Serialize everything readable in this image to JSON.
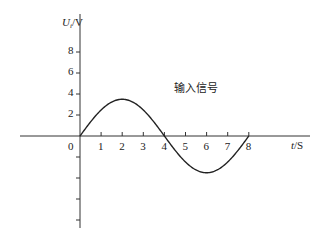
{
  "chart_data": {
    "type": "line",
    "title": "",
    "xlabel": "t/S",
    "ylabel": "U_i/V",
    "xlim": [
      0,
      8
    ],
    "ylim": [
      -8,
      8
    ],
    "x_ticks": [
      0,
      1,
      2,
      3,
      4,
      5,
      6,
      7,
      8
    ],
    "x_tick_labels": [
      "0",
      "1",
      "2",
      "3",
      "4",
      "5",
      "6",
      "7",
      "8"
    ],
    "y_ticks": [
      2,
      4,
      6,
      8,
      -2,
      -4,
      -6,
      -8
    ],
    "y_tick_labels": [
      "2",
      "4",
      "6",
      "8",
      "",
      "",
      "",
      ""
    ],
    "grid": false,
    "legend": null,
    "annotations": [
      {
        "text": "输入信号",
        "x": 4.3,
        "y": 4.3
      }
    ],
    "series": [
      {
        "name": "输入信号",
        "function": "U = 3.5*sin(2*pi*t/8)",
        "x": [
          0,
          0.5,
          1,
          1.5,
          2,
          2.5,
          3,
          3.5,
          4,
          4.5,
          5,
          5.5,
          6,
          6.5,
          7,
          7.5,
          8
        ],
        "values": [
          0,
          1.34,
          2.47,
          3.23,
          3.5,
          3.23,
          2.47,
          1.34,
          0,
          -1.34,
          -2.47,
          -3.23,
          -3.5,
          -3.23,
          -2.47,
          -1.34,
          0
        ]
      }
    ]
  },
  "labels": {
    "y_axis": "U",
    "y_axis_sub": "i",
    "y_axis_unit": "/V",
    "x_axis": "t",
    "x_axis_unit": "/S",
    "origin": "0",
    "annotation": "输入信号"
  },
  "colors": {
    "line": "#222222",
    "axis": "#333333",
    "background": "#ffffff"
  }
}
